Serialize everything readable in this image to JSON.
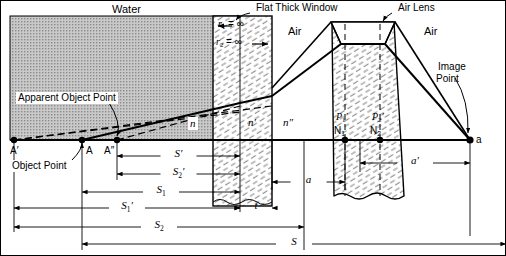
{
  "figure": {
    "width": 506,
    "height": 256,
    "background": "#ffffff",
    "ink": "#000000",
    "water_fill": "#b8b8b8",
    "glass_hatch": "#7a7a7a"
  },
  "region_labels": {
    "water": "Water",
    "flat_thick_window": "Flat Thick Window",
    "air_lens": "Air Lens",
    "air_left": "Air",
    "air_right": "Air"
  },
  "callouts": {
    "apparent_object_point": "Apparent Object Point",
    "object_point": "Object Point",
    "image_point_line1": "Image",
    "image_point_line2": "Point"
  },
  "radius_labels": {
    "r1": "r",
    "r1_sub": "1",
    "r1_eq": "= ∞",
    "r2": "r",
    "r2_sub": "2",
    "r2_eq": "= ∞"
  },
  "index_labels": {
    "n": "n",
    "n_prime": "n′",
    "n_double_prime": "n″"
  },
  "axis_points": {
    "a_prime": "A′",
    "a": "A",
    "a_double_prime": "A″",
    "image_a": "a"
  },
  "cardinal_points": {
    "p1_prime": "P",
    "p1_prime_sub": "1",
    "p2_prime": "P",
    "p2_prime_sub": "2",
    "n1": "N",
    "n1_sub": "1",
    "n2": "N",
    "n2_sub": "2"
  },
  "dimensions": [
    {
      "id": "s-prime",
      "symbol": "S",
      "prime": "′",
      "sub": "",
      "y": 156,
      "x1": 117,
      "x2": 240,
      "arrows": "both"
    },
    {
      "id": "s2-prime",
      "symbol": "S",
      "prime": "′",
      "sub": "2",
      "y": 174,
      "x1": 117,
      "x2": 240,
      "arrows": "both"
    },
    {
      "id": "s1",
      "symbol": "S",
      "prime": "",
      "sub": "1",
      "y": 192,
      "x1": 82,
      "x2": 240,
      "arrows": "both"
    },
    {
      "id": "s1-prime",
      "symbol": "S",
      "prime": "′",
      "sub": "1",
      "y": 208,
      "x1": 14,
      "x2": 240,
      "arrows": "both"
    },
    {
      "id": "s2",
      "symbol": "S",
      "prime": "",
      "sub": "2",
      "y": 227,
      "x1": 14,
      "x2": 304,
      "arrows": "both"
    },
    {
      "id": "s",
      "symbol": "S",
      "prime": "",
      "sub": "",
      "y": 244,
      "x1": 82,
      "x2": 506,
      "arrows": "both"
    },
    {
      "id": "t",
      "symbol": "t",
      "prime": "",
      "sub": "",
      "y": 208,
      "x1": 240,
      "x2": 272,
      "arrows": "both"
    },
    {
      "id": "a-gap",
      "symbol": "a",
      "prime": "",
      "sub": "",
      "y": 182,
      "x1": 272,
      "x2": 345,
      "arrows": "both"
    },
    {
      "id": "a-prime",
      "symbol": "a",
      "prime": "′",
      "sub": "",
      "y": 163,
      "x1": 360,
      "x2": 470,
      "arrows": "both"
    }
  ]
}
